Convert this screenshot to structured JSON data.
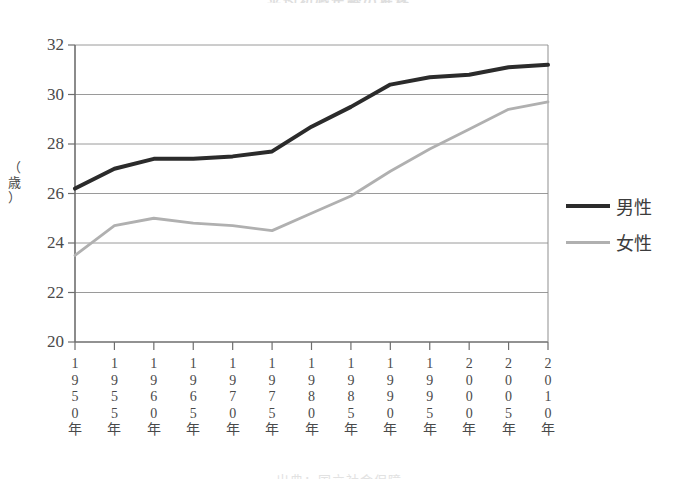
{
  "title": "平均初婚年齢の推移",
  "caption": "出典：国立社会保障",
  "y_axis_unit_chars": [
    "（",
    "歳",
    "）"
  ],
  "legend": {
    "male": {
      "label": "男性",
      "color": "#2b2b2b"
    },
    "female": {
      "label": "女性",
      "color": "#b0b0b0"
    }
  },
  "chart_data": {
    "type": "line",
    "title": "平均初婚年齢の推移",
    "xlabel": "",
    "ylabel": "（歳）",
    "ylim": [
      20,
      32
    ],
    "ytick_labels": [
      "32",
      "30",
      "28",
      "26",
      "24",
      "22",
      "20"
    ],
    "ytick_values": [
      32,
      30,
      28,
      26,
      24,
      22,
      20
    ],
    "grid": true,
    "legend_position": "right",
    "categories": [
      "1950年",
      "1955年",
      "1960年",
      "1965年",
      "1970年",
      "1975年",
      "1980年",
      "1985年",
      "1990年",
      "1995年",
      "2000年",
      "2005年",
      "2010年"
    ],
    "x_tick_chars": [
      [
        "1",
        "9",
        "5",
        "0",
        "年"
      ],
      [
        "1",
        "9",
        "5",
        "5",
        "年"
      ],
      [
        "1",
        "9",
        "6",
        "0",
        "年"
      ],
      [
        "1",
        "9",
        "6",
        "5",
        "年"
      ],
      [
        "1",
        "9",
        "7",
        "0",
        "年"
      ],
      [
        "1",
        "9",
        "7",
        "5",
        "年"
      ],
      [
        "1",
        "9",
        "8",
        "0",
        "年"
      ],
      [
        "1",
        "9",
        "8",
        "5",
        "年"
      ],
      [
        "1",
        "9",
        "9",
        "0",
        "年"
      ],
      [
        "1",
        "9",
        "9",
        "5",
        "年"
      ],
      [
        "2",
        "0",
        "0",
        "0",
        "年"
      ],
      [
        "2",
        "0",
        "0",
        "5",
        "年"
      ],
      [
        "2",
        "0",
        "1",
        "0",
        "年"
      ]
    ],
    "series": [
      {
        "name": "男性",
        "color": "#2b2b2b",
        "values": [
          26.2,
          27.0,
          27.4,
          27.4,
          27.5,
          27.7,
          28.7,
          29.5,
          30.4,
          30.7,
          30.8,
          31.1,
          31.2
        ]
      },
      {
        "name": "女性",
        "color": "#b0b0b0",
        "values": [
          23.5,
          24.7,
          25.0,
          24.8,
          24.7,
          24.5,
          25.2,
          25.9,
          26.9,
          27.8,
          28.6,
          29.4,
          29.7
        ]
      }
    ]
  }
}
